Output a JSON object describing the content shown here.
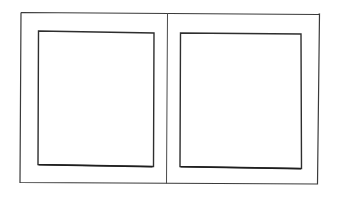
{
  "diagram": {
    "type": "line-drawing",
    "stroke_color": "#333333",
    "background_color": "#ffffff",
    "outer_frame": {
      "x": 20,
      "y": 12,
      "width": 299,
      "height": 172
    },
    "divider": {
      "x": 167,
      "y1": 12,
      "y2": 184
    },
    "panes": [
      {
        "label": "left-pane",
        "x": 38,
        "y": 31,
        "width": 116,
        "height": 135
      },
      {
        "label": "right-pane",
        "x": 180,
        "y": 33,
        "width": 122,
        "height": 135
      }
    ]
  }
}
